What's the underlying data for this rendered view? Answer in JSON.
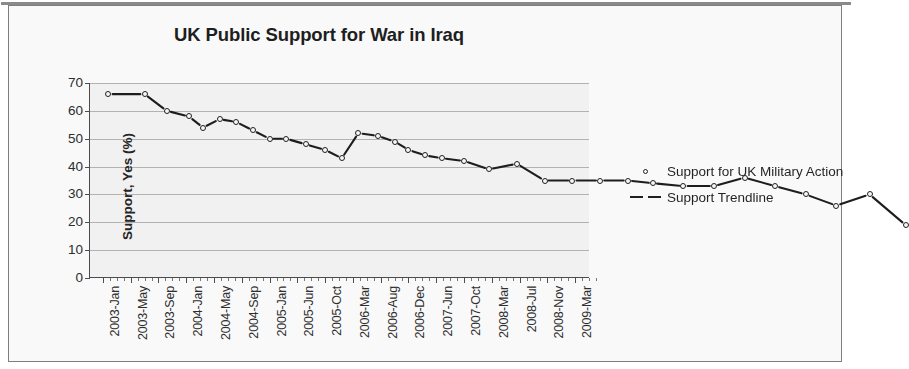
{
  "chart_data": {
    "type": "scatter",
    "title": "UK Public Support for War in Iraq",
    "xlabel": "",
    "ylabel": "Support, Yes (%)",
    "ylim": [
      0,
      70
    ],
    "ytick_step": 10,
    "yticks": [
      "70",
      "60",
      "50",
      "40",
      "30",
      "20",
      "10",
      "0"
    ],
    "grid": true,
    "legend_position": "right",
    "xtick_labels": [
      "2003-Jan",
      "2003-May",
      "2003-Sep",
      "2004-Jan",
      "2004-May",
      "2004-Sep",
      "2005-Jan",
      "2005-Jun",
      "2005-Oct",
      "2006-Mar",
      "2006-Aug",
      "2006-Dec",
      "2007-Jun",
      "2007-Oct",
      "2008-Mar",
      "2008-Jul",
      "2008-Nov",
      "2009-Mar"
    ],
    "series": [
      {
        "name": "Support for UK Military Action",
        "marker": "open-circle",
        "x": [
          0.2,
          1.5,
          2.3,
          3.1,
          3.6,
          4.2,
          4.8,
          5.4,
          6.0,
          6.6,
          7.3,
          8.0,
          8.6,
          9.2,
          9.9,
          10.5,
          11.0,
          11.6,
          12.2,
          13.0,
          13.9,
          14.9,
          15.9,
          16.9,
          17.9,
          18.9,
          19.8,
          20.9,
          22.0,
          23.1,
          24.2,
          25.3,
          26.4,
          27.6,
          28.9
        ],
        "values": [
          66,
          66,
          60,
          58,
          54,
          57,
          56,
          53,
          50,
          50,
          48,
          46,
          43,
          52,
          51,
          49,
          46,
          44,
          43,
          42,
          39,
          41,
          35,
          35,
          35,
          35,
          34,
          33,
          33,
          36,
          33,
          30,
          26,
          30,
          19
        ]
      },
      {
        "name": "Support Trendline",
        "marker": "dashed-line",
        "style": "dashed"
      }
    ]
  },
  "legend": {
    "items": [
      {
        "label": "Support for UK Military Action",
        "key": "open-circle"
      },
      {
        "label": "Support Trendline",
        "key": "dashed-line"
      }
    ]
  }
}
